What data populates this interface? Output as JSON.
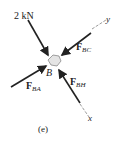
{
  "diagram": {
    "node": "B",
    "caption": "(e)",
    "forces": [
      {
        "id": "load",
        "label": "2 kN"
      },
      {
        "id": "FBC",
        "symbol": "F",
        "subscript": "BC"
      },
      {
        "id": "FBA",
        "symbol": "F",
        "subscript": "BA"
      },
      {
        "id": "FBH",
        "symbol": "F",
        "subscript": "BH"
      }
    ],
    "axes": {
      "x": "x",
      "y": "y"
    },
    "colors": {
      "ink": "#222222",
      "node_fill": "#e4e4e4"
    }
  }
}
